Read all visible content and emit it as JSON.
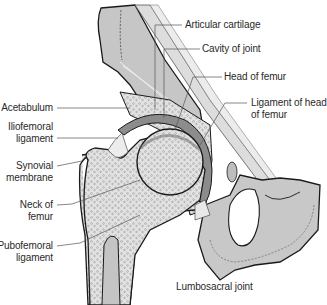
{
  "diagram": {
    "labels": {
      "articular_cartilage": "Articular cartilage",
      "cavity_of_joint": "Cavity of joint",
      "head_of_femur": "Head of femur",
      "ligament_of_head_line1": "Ligament of head",
      "ligament_of_head_line2": "of femur",
      "acetabulum": "Acetabulum",
      "iliofemoral_line1": "Iliofemoral",
      "iliofemoral_line2": "ligament",
      "synovial_line1": "Synovial",
      "synovial_line2": "membrane",
      "neck_line1": "Neck of",
      "neck_line2": "femur",
      "pubofemoral_line1": "Pubofemoral",
      "pubofemoral_line2": "ligament",
      "lumbosacral": "Lumbosacral joint"
    },
    "colors": {
      "bone_gray": "#c8c8c8",
      "bone_light": "#dcdcdc",
      "ligament_light": "#e6e6e6",
      "cartilage_dark": "#8a8a8a",
      "outline": "#1a1a1a",
      "leader_line": "#555555"
    }
  }
}
